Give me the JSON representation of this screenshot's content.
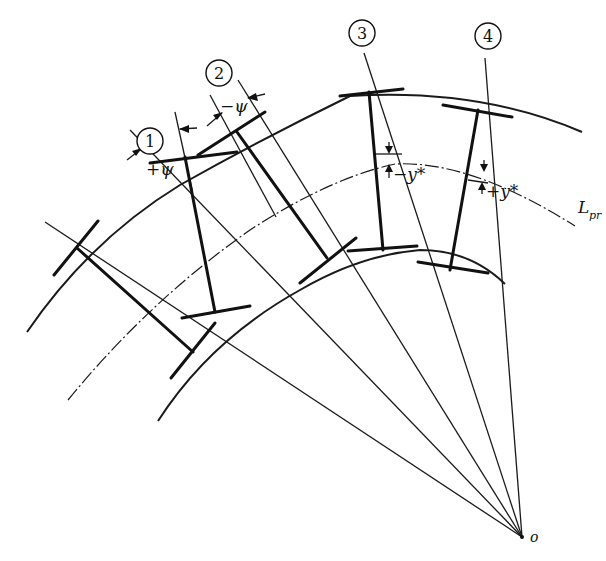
{
  "figure": {
    "labels": {
      "tool_1": "1",
      "tool_2": "2",
      "tool_3": "3",
      "tool_4": "4",
      "plus_psi": "+ψ",
      "minus_psi": "−ψ",
      "minus_y_star": "−y*",
      "plus_y_star": "+y*",
      "pitch_line": "L",
      "pitch_line_sub": "pr",
      "center": "o"
    },
    "colors": {
      "ink": "#111111",
      "background": "#ffffff"
    }
  }
}
